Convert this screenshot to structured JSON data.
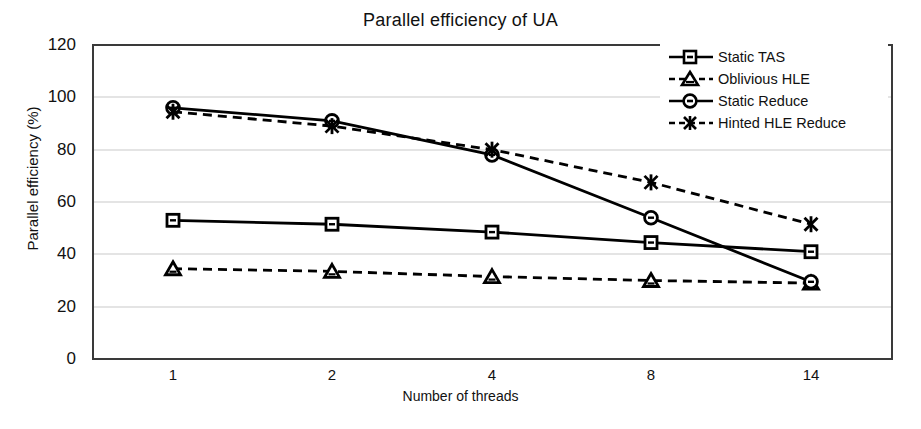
{
  "chart_data": {
    "type": "line",
    "title": "Parallel efficiency of UA",
    "xlabel": "Number of threads",
    "ylabel": "Parallel efficiency (%)",
    "categories": [
      "1",
      "2",
      "4",
      "8",
      "14"
    ],
    "x_tick_labels": [
      "1",
      "2",
      "4",
      "8",
      "14"
    ],
    "y_tick_labels": [
      "0",
      "20",
      "40",
      "60",
      "80",
      "100",
      "120"
    ],
    "ylim": [
      0,
      120
    ],
    "y_ticks": [
      0,
      20,
      40,
      60,
      80,
      100,
      120
    ],
    "grid": "horizontal",
    "legend_position": "top-right",
    "series": [
      {
        "name": "Static TAS",
        "values": [
          53,
          51.5,
          48.5,
          44.5,
          41
        ],
        "line_style": "solid",
        "marker": "square",
        "color": "#000000"
      },
      {
        "name": "Oblivious HLE",
        "values": [
          34.5,
          33.5,
          31.5,
          30,
          29
        ],
        "line_style": "dashed",
        "marker": "triangle",
        "color": "#000000"
      },
      {
        "name": "Static Reduce",
        "values": [
          96,
          91,
          78,
          54,
          29.5
        ],
        "line_style": "solid",
        "marker": "circle",
        "color": "#000000"
      },
      {
        "name": "Hinted HLE Reduce",
        "values": [
          94.5,
          89,
          80,
          67.5,
          51.5
        ],
        "line_style": "dashed",
        "marker": "x",
        "color": "#000000"
      }
    ]
  },
  "legend": {
    "items": [
      {
        "label": "Static TAS"
      },
      {
        "label": "Oblivious HLE"
      },
      {
        "label": "Static Reduce"
      },
      {
        "label": "Hinted HLE Reduce"
      }
    ]
  }
}
